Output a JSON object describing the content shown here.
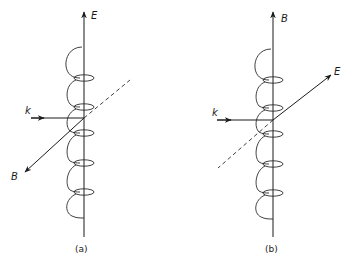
{
  "figure": {
    "panels": [
      {
        "id": "a",
        "caption": "(a)",
        "vertical_axis_label": "E",
        "horizontal_axis_label": "k",
        "oblique_axis_label": "B",
        "oblique_direction": "down-left",
        "dashed_direction": "up-right"
      },
      {
        "id": "b",
        "caption": "(b)",
        "vertical_axis_label": "B",
        "horizontal_axis_label": "k",
        "oblique_axis_label": "E",
        "oblique_direction": "up-right",
        "dashed_direction": "down-left"
      }
    ],
    "colors": {
      "ink": "#1a1a1a",
      "background": "#ffffff"
    }
  }
}
